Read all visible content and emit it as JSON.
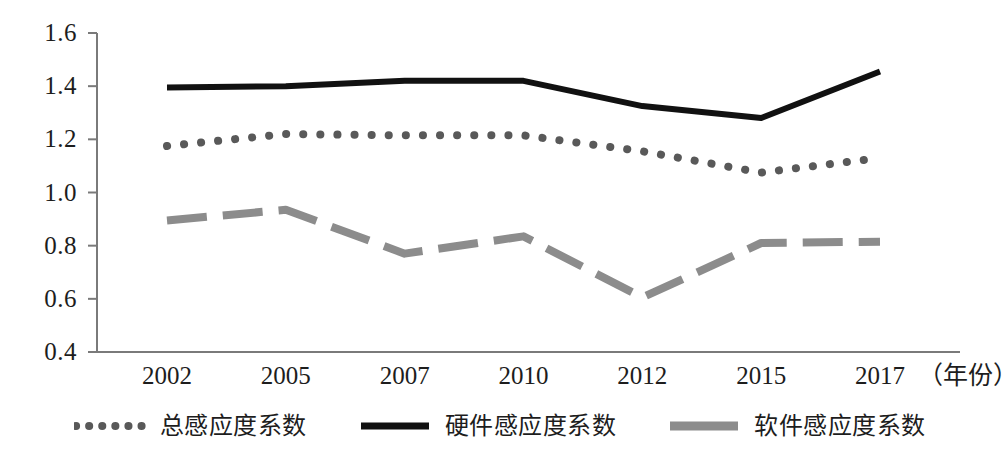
{
  "chart_data": {
    "type": "line",
    "title": "",
    "subtitle": "",
    "xlabel": "年份",
    "ylabel": "",
    "categories": [
      "2002",
      "2005",
      "2007",
      "2010",
      "2012",
      "2015",
      "2017"
    ],
    "x_unit_note": "（年份）",
    "ylim": [
      0.4,
      1.6
    ],
    "yticks": [
      "1.6",
      "1.4",
      "1.2",
      "1.0",
      "0.8",
      "0.6",
      "0.4"
    ],
    "ytick_values": [
      1.6,
      1.4,
      1.2,
      1.0,
      0.8,
      0.6,
      0.4
    ],
    "grid": false,
    "legend_position": "bottom",
    "series": [
      {
        "name": "总感应度系数",
        "style": "dotted",
        "color": "#595959",
        "values": [
          1.175,
          1.22,
          1.215,
          1.215,
          1.155,
          1.075,
          1.13
        ]
      },
      {
        "name": "硬件感应度系数",
        "style": "solid",
        "color": "#111111",
        "values": [
          1.395,
          1.4,
          1.42,
          1.42,
          1.325,
          1.28,
          1.455
        ]
      },
      {
        "name": "软件感应度系数",
        "style": "dashed",
        "color": "#8c8c8c",
        "values": [
          0.895,
          0.935,
          0.77,
          0.835,
          0.605,
          0.81,
          0.815
        ]
      }
    ],
    "axis_color": "#7a7a7a"
  }
}
